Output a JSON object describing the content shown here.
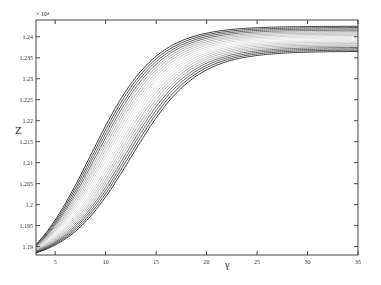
{
  "chart_data": {
    "type": "line",
    "title": "",
    "xlabel": "γ",
    "ylabel": "Z",
    "y_multiplier": "× 10⁴",
    "xlim": [
      3.1,
      35
    ],
    "ylim": [
      1.188,
      1.244
    ],
    "xticks": [
      5,
      10,
      15,
      20,
      25,
      30,
      35
    ],
    "yticks": [
      1.19,
      1.195,
      1.2,
      1.205,
      1.21,
      1.215,
      1.22,
      1.225,
      1.23,
      1.235,
      1.24
    ],
    "ytick_labels": [
      "1.19",
      "1.195",
      "1.2",
      "1.205",
      "1.21",
      "1.215",
      "1.22",
      "1.225",
      "1.23",
      "1.235",
      "1.24"
    ],
    "grid": false,
    "legend": "none",
    "series_params": {
      "count": 20,
      "start_y": [
        1.1905,
        1.1885
      ],
      "end_y": [
        1.2425,
        1.2365
      ],
      "midpoint_x": [
        8.5,
        12.5
      ]
    }
  }
}
